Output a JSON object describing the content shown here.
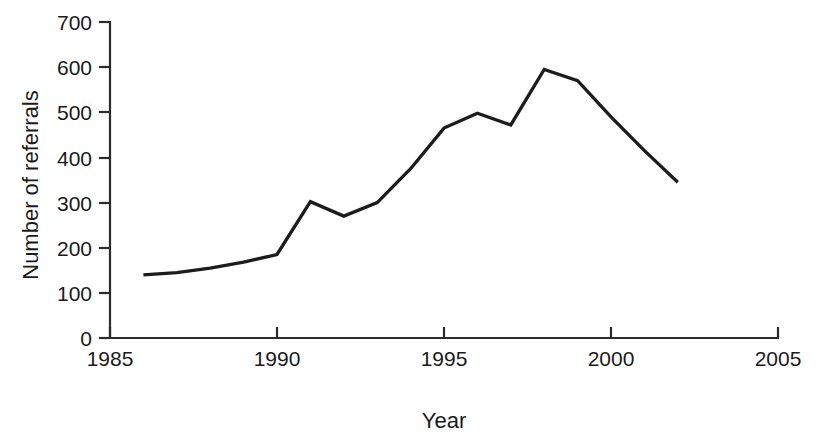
{
  "chart_data": {
    "type": "line",
    "title": "",
    "subtitle": "",
    "xlabel": "Year",
    "ylabel": "Number of referrals",
    "xlim": [
      1985,
      2005
    ],
    "ylim": [
      0,
      700
    ],
    "xticks": [
      1985,
      1990,
      1995,
      2000,
      2005
    ],
    "xtick_labels": [
      "1985",
      "1990",
      "1995",
      "2000",
      "2005"
    ],
    "yticks": [
      0,
      100,
      200,
      300,
      400,
      500,
      600,
      700
    ],
    "ytick_labels": [
      "0",
      "100",
      "200",
      "300",
      "400",
      "500",
      "600",
      "700"
    ],
    "grid": false,
    "legend": false,
    "legend_position": "none",
    "series": [
      {
        "name": "Number of referrals",
        "color": "#1c1c1c",
        "x": [
          1986,
          1987,
          1988,
          1989,
          1990,
          1991,
          1992,
          1993,
          1994,
          1995,
          1996,
          1997,
          1998,
          1999,
          2000,
          2001,
          2002
        ],
        "values": [
          140,
          145,
          155,
          168,
          185,
          302,
          270,
          300,
          375,
          465,
          498,
          472,
          595,
          570,
          490,
          415,
          345
        ]
      }
    ],
    "annotations": []
  },
  "axes": {
    "y_axis_title": "Number of referrals",
    "x_axis_title": "Year"
  }
}
